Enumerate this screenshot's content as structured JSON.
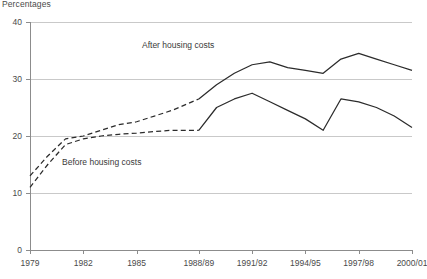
{
  "chart_data": {
    "type": "line",
    "title": "",
    "unit_label": "Percentages",
    "xlabel": "",
    "ylabel": "",
    "ylim": [
      0,
      40
    ],
    "yticks": [
      0,
      10,
      20,
      30,
      40
    ],
    "xlim": [
      1979,
      2000.5
    ],
    "xtick_labels": [
      "1979",
      "1982",
      "1985",
      "1988/89",
      "1991/92",
      "1994/95",
      "1997/98",
      "2000/01"
    ],
    "xtick_values": [
      1979,
      1982,
      1985,
      1988.5,
      1991.5,
      1994.5,
      1997.5,
      2000.5
    ],
    "grid": "horizontal",
    "legend_position": "inline-annotations",
    "line_color": "#2b2b2b",
    "grid_color": "#c9c9c9",
    "axis_color": "#8c8c8c",
    "dash_note": "Both series drawn dashed from 1979 to 1988/89, solid thereafter",
    "series": [
      {
        "name": "After housing costs",
        "style_dashed_until": 1988.5,
        "x": [
          1979,
          1980,
          1981,
          1982,
          1983,
          1984,
          1985,
          1986,
          1987,
          1988.5,
          1989.5,
          1990.5,
          1991.5,
          1992.5,
          1993.5,
          1994.5,
          1995.5,
          1996.5,
          1997.5,
          1998.5,
          1999.5,
          2000.5
        ],
        "values": [
          13.0,
          16.5,
          19.5,
          20.0,
          21.0,
          22.0,
          22.5,
          23.5,
          24.5,
          26.5,
          29.0,
          31.0,
          32.5,
          33.0,
          32.0,
          31.5,
          31.0,
          33.5,
          34.5,
          33.5,
          32.5,
          31.5
        ]
      },
      {
        "name": "Before housing costs",
        "style_dashed_until": 1988.5,
        "x": [
          1979,
          1980,
          1981,
          1982,
          1983,
          1984,
          1985,
          1986,
          1987,
          1988.5,
          1989.5,
          1990.5,
          1991.5,
          1992.5,
          1993.5,
          1994.5,
          1995.5,
          1996.5,
          1997.5,
          1998.5,
          1999.5,
          2000.5
        ],
        "values": [
          11.0,
          15.0,
          18.5,
          19.5,
          20.0,
          20.3,
          20.5,
          20.8,
          21.0,
          21.0,
          25.0,
          26.5,
          27.5,
          26.0,
          24.5,
          23.0,
          21.0,
          26.5,
          26.0,
          25.0,
          23.5,
          21.5
        ]
      }
    ],
    "annotations": [
      {
        "text": "After housing costs",
        "x_px": 142,
        "y_px": 40
      },
      {
        "text": "Before housing costs",
        "x_px": 62,
        "y_px": 157
      }
    ]
  }
}
